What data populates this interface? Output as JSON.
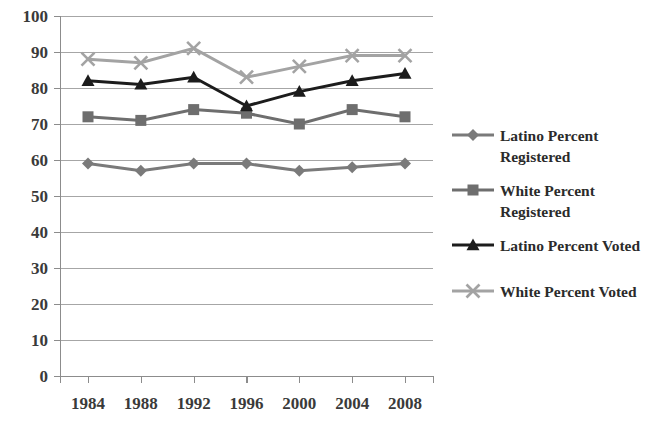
{
  "chart_data": {
    "type": "line",
    "title": "",
    "subtitle": "",
    "xlabel": "",
    "ylabel": "",
    "x": [
      "1984",
      "1988",
      "1992",
      "1996",
      "2000",
      "2004",
      "2008"
    ],
    "categories": [
      "1984",
      "1988",
      "1992",
      "1996",
      "2000",
      "2004",
      "2008"
    ],
    "xlim": [
      1984,
      2008
    ],
    "ylim": [
      0,
      100
    ],
    "ytick_labels": [
      "0",
      "10",
      "20",
      "30",
      "40",
      "50",
      "60",
      "70",
      "80",
      "90",
      "100"
    ],
    "ytick_values": [
      0,
      10,
      20,
      30,
      40,
      50,
      60,
      70,
      80,
      90,
      100
    ],
    "grid": "horizontal",
    "legend_position": "right",
    "series": [
      {
        "name": "Latino Percent Registered",
        "label_line1": "Latino Percent",
        "label_line2": "Registered",
        "marker": "diamond",
        "color": "#7a7a7a",
        "values": [
          59,
          57,
          59,
          59,
          57,
          58,
          59
        ]
      },
      {
        "name": "White Percent Registered",
        "label_line1": "White Percent",
        "label_line2": "Registered",
        "marker": "square",
        "color": "#6e6e6e",
        "values": [
          72,
          71,
          74,
          73,
          70,
          74,
          72
        ]
      },
      {
        "name": "Latino Percent Voted",
        "label_line1": "Latino Percent Voted",
        "label_line2": "",
        "marker": "triangle",
        "color": "#1c1c1c",
        "values": [
          82,
          81,
          83,
          75,
          79,
          82,
          84
        ]
      },
      {
        "name": "White Percent Voted",
        "label_line1": "White Percent Voted",
        "label_line2": "",
        "marker": "cross",
        "color": "#a3a3a3",
        "values": [
          88,
          87,
          91,
          83,
          86,
          89,
          89
        ]
      }
    ]
  },
  "colors": {
    "background": "#ffffff",
    "gridline": "#a6a6a6",
    "axis": "#8c8c8c",
    "tick_text": "#3a3a3a",
    "legend_text": "#2b2b2b"
  },
  "legend": {
    "items": [
      {
        "label_line1": "Latino Percent",
        "label_line2": "Registered"
      },
      {
        "label_line1": "White Percent",
        "label_line2": "Registered"
      },
      {
        "label_line1": "Latino Percent Voted",
        "label_line2": ""
      },
      {
        "label_line1": "White Percent Voted",
        "label_line2": ""
      }
    ]
  }
}
